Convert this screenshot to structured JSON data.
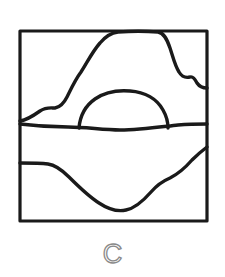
{
  "figure": {
    "caption": "C",
    "caption_color": "#8a8a8a",
    "background_color": "#ffffff",
    "ink_color": "#1a1a1a",
    "frame": {
      "label": "square-border",
      "x": 20,
      "y": 31,
      "width": 187,
      "height": 190,
      "stroke_width": 3.2
    },
    "strokes": [
      {
        "name": "mountain-ridge-curve",
        "description": "wavy ridge line rising from left edge to a flat plateau along the top, then stepping down to the right edge",
        "stroke_width": 3.4,
        "path": "M 20 121 C 27 120 33 116 40 111 C 46 107 50 108 55 108 C 61 107 64 103 67 97 C 71 89 75 80 81 72 C 87 63 92 52 100 43 C 105 37 110 33 118 32 C 131 31 146 31 158 32 C 164 33 167 39 170 48 C 173 57 175 66 179 72 C 182 77 186 78 190 77 C 193 76 195 79 197 83 C 199 86 202 88 207 88"
      },
      {
        "name": "dome-arch-curve",
        "description": "rounded dome / arch sitting on the horizontal divider in the middle of the square",
        "stroke_width": 3.4,
        "path": "M 79 128 C 80 116 85 106 95 99 C 105 92 118 90 130 91 C 145 92 157 99 163 110 C 167 117 168 122 168 128"
      },
      {
        "name": "horizontal-divider-line",
        "description": "slightly wavy horizontal line crossing the full width of the square near mid height",
        "stroke_width": 3.4,
        "path": "M 20 124 C 36 126 52 127 68 127 C 86 127 103 130 120 130 C 140 130 160 127 178 125 C 190 124 199 124 207 124"
      },
      {
        "name": "valley-basin-curve",
        "description": "U shaped valley curve in the lower half, flat at left, dipping to a low point near bottom centre, rising steeply to the right edge",
        "stroke_width": 3.4,
        "path": "M 20 163 C 30 163 40 163 48 164 C 56 165 62 170 69 177 C 78 186 88 196 99 203 C 108 209 117 212 126 210 C 136 208 144 200 151 192 C 157 185 163 181 170 178 C 178 174 185 168 192 160 C 198 154 203 150 207 147"
      }
    ]
  }
}
